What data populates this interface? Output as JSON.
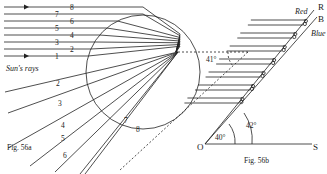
{
  "fig_a": {
    "caption": "Fig. 56a",
    "sun_label": "Sun's rays",
    "incoming_rays": [
      {
        "label": "8",
        "y": 7,
        "lx": 70
      },
      {
        "label": "7",
        "y": 14,
        "lx": 55
      },
      {
        "label": "6",
        "y": 21,
        "lx": 70
      },
      {
        "label": "5",
        "y": 28,
        "lx": 55
      },
      {
        "label": "4",
        "y": 35,
        "lx": 70
      },
      {
        "label": "3",
        "y": 42,
        "lx": 55
      },
      {
        "label": "2",
        "y": 49,
        "lx": 70
      },
      {
        "label": "1",
        "y": 56,
        "lx": 55
      }
    ],
    "outgoing_rays": [
      {
        "label": "2",
        "x1": 178,
        "y1": 52,
        "x2": 5,
        "y2": 92,
        "lx": 56,
        "ly": 86
      },
      {
        "label": "3",
        "x1": 178,
        "y1": 52,
        "x2": 8,
        "y2": 113,
        "lx": 58,
        "ly": 106
      },
      {
        "label": "4",
        "x1": 178,
        "y1": 52,
        "x2": 8,
        "y2": 148,
        "lx": 61,
        "ly": 128
      },
      {
        "label": "5",
        "x1": 178,
        "y1": 52,
        "x2": 30,
        "y2": 166,
        "lx": 61,
        "ly": 141
      },
      {
        "label": "6",
        "x1": 178,
        "y1": 52,
        "x2": 55,
        "y2": 172,
        "lx": 63,
        "ly": 158
      },
      {
        "label": "7",
        "x1": 178,
        "y1": 52,
        "x2": 85,
        "y2": 174,
        "lx": 124,
        "ly": 123
      },
      {
        "label": "8",
        "x1": 178,
        "y1": 52,
        "x2": 80,
        "y2": 174,
        "lx": 136,
        "ly": 132
      }
    ],
    "angle_label": "41°"
  },
  "fig_b": {
    "caption": "Fig. 56b",
    "origin_label": "O",
    "s_label": "S",
    "r_label": "R",
    "b_label": "B",
    "red_label": "Red",
    "blue_label": "Blue",
    "angle_40": "40°",
    "angle_42": "42°"
  }
}
